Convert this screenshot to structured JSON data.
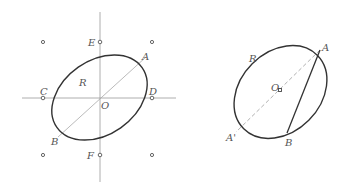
{
  "colors": {
    "curve": "#333333",
    "axis": "#9a9a9a",
    "guide": "#a8a8a8",
    "label": "#555555",
    "background": "#ffffff"
  },
  "left_figure": {
    "labels": {
      "E": "E",
      "A": "A",
      "R": "R",
      "C": "C",
      "D": "D",
      "O": "O",
      "B": "B",
      "F": "F"
    },
    "grid_points": 9,
    "elements": [
      "ellipse R",
      "horizontal axis",
      "vertical axis",
      "diameter AB through O"
    ]
  },
  "right_figure": {
    "labels": {
      "R": "R",
      "A": "A",
      "O": "O",
      "A_prime": "A'",
      "B": "B"
    },
    "elements": [
      "ellipse R",
      "dashed diameter AA' through O",
      "solid chord AB"
    ]
  }
}
